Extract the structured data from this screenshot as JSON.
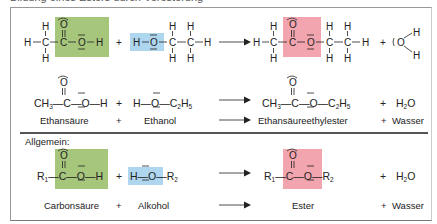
{
  "caption_partial": "Bildung eines Esters durch Veresterung",
  "reaction_structural": {
    "reactant1": "Ethansäure (Strukturformel)",
    "reactant2": "Ethanol (Strukturformel)",
    "product1": "Ethansäureethylester (Strukturformel)",
    "product2": "Wasser",
    "plus": "+",
    "h": "H",
    "c": "C",
    "o": "O"
  },
  "reaction_condensed": {
    "reactant1": {
      "prefix": "CH",
      "sub": "3",
      "rest": "—C—O—H"
    },
    "reactant2": {
      "text": "H—O—C",
      "sub1": "2",
      "mid": "H",
      "sub2": "5"
    },
    "product1": {
      "prefix": "CH",
      "sub": "3",
      "rest": "—C—O—C",
      "sub2": "2",
      "mid": "H",
      "sub3": "5"
    },
    "product2": {
      "pre": "H",
      "sub": "2",
      "post": "O"
    },
    "plus": "+"
  },
  "names": {
    "reactant1": "Ethansäure",
    "reactant2": "Ethanol",
    "product1": "Ethansäureethylester",
    "product2": "Wasser",
    "plus": "+"
  },
  "general": {
    "heading": "Allgemein:",
    "reactant1": {
      "r": "R",
      "rsub": "1",
      "rest": "—C—O—H"
    },
    "reactant2": {
      "text": "H—O—R",
      "sub": "2"
    },
    "product1": {
      "r": "R",
      "rsub": "1",
      "rest": "—C—O—R",
      "sub": "2"
    },
    "product2": {
      "pre": "H",
      "sub": "2",
      "post": "O"
    },
    "names": {
      "reactant1": "Carbonsäure",
      "reactant2": "Alkohol",
      "product1": "Ester",
      "product2": "Wasser",
      "plus": "+"
    }
  },
  "colors": {
    "acid_group": "#a6c67c",
    "alcohol_group": "#aed6ef",
    "ester_group": "#f2a5ae"
  }
}
